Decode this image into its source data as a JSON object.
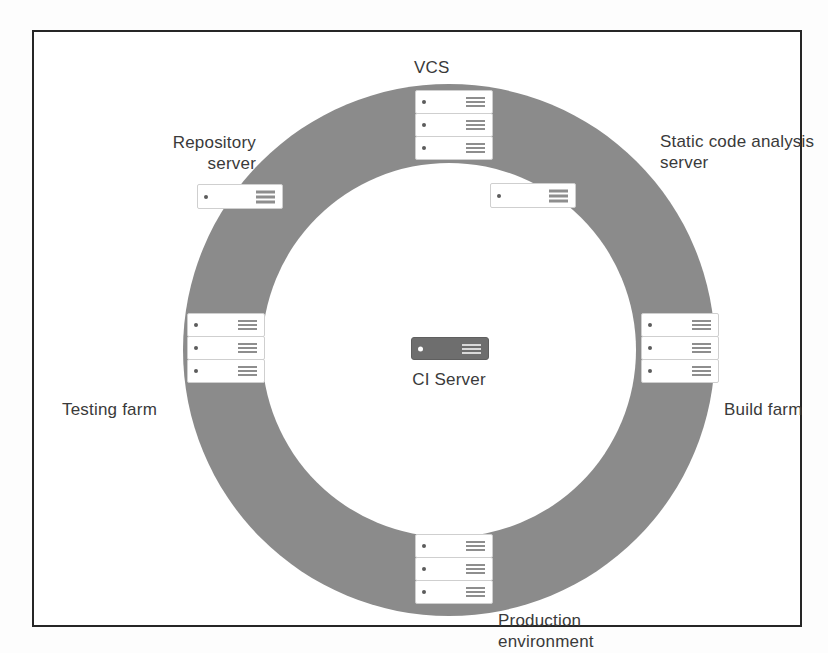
{
  "diagram": {
    "ring_color": "#8b8b8b",
    "frame_color": "#262626",
    "background_color": "#ffffff",
    "center": {
      "label": "CI Server",
      "icon": "server-icon",
      "units": 1,
      "style": "dark"
    },
    "nodes": [
      {
        "id": "vcs",
        "label": "VCS",
        "units": 3,
        "icon": "server-stack-icon",
        "position": "top"
      },
      {
        "id": "repository-server",
        "label": "Repository\nserver",
        "units": 1,
        "icon": "server-icon",
        "position": "top-left"
      },
      {
        "id": "static-code-analysis-server",
        "label": "Static code analysis\nserver",
        "units": 1,
        "icon": "server-icon",
        "position": "top-right"
      },
      {
        "id": "testing-farm",
        "label": "Testing farm",
        "units": 3,
        "icon": "server-stack-icon",
        "position": "left"
      },
      {
        "id": "build-farm",
        "label": "Build farm",
        "units": 3,
        "icon": "server-stack-icon",
        "position": "right"
      },
      {
        "id": "production-environment",
        "label": "Production\nenvironment",
        "units": 3,
        "icon": "server-stack-icon",
        "position": "bottom"
      }
    ]
  }
}
